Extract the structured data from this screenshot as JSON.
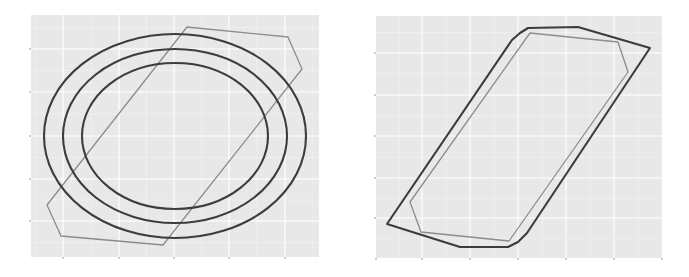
{
  "figure": {
    "background": "#ffffff",
    "panel_bg": "#e8e8e8",
    "grid_major": "#ffffff",
    "grid_minor": "#f3f3f3",
    "tick_color": "#9a9a9a",
    "dark_line": "#3c3c3c",
    "light_line": "#8c8c8c"
  },
  "chart_data": [
    {
      "type": "line",
      "title": "",
      "xlabel": "",
      "ylabel": "",
      "grid": true,
      "legend": null,
      "tick_labels_visible": false,
      "panel": {
        "x": 31,
        "y": 15,
        "w": 288,
        "h": 242
      },
      "x_ticks_px": [
        63,
        119,
        174,
        229,
        285
      ],
      "y_ticks_px": [
        49,
        92,
        136,
        179,
        221
      ],
      "series": [
        {
          "name": "ellipse-outer",
          "shape": "ellipse",
          "color": "dark",
          "cx": 175,
          "cy": 136,
          "rx": 131,
          "ry": 102
        },
        {
          "name": "ellipse-middle",
          "shape": "ellipse",
          "color": "dark",
          "cx": 175,
          "cy": 136,
          "rx": 112,
          "ry": 87
        },
        {
          "name": "ellipse-inner",
          "shape": "ellipse",
          "color": "dark",
          "cx": 175,
          "cy": 136,
          "rx": 93,
          "ry": 73
        },
        {
          "name": "hull-polygon",
          "shape": "polygon",
          "color": "light",
          "points": [
            [
              187,
              27
            ],
            [
              288,
              37
            ],
            [
              302,
              69
            ],
            [
              163,
              245
            ],
            [
              61,
              236
            ],
            [
              47,
              205
            ]
          ]
        }
      ]
    },
    {
      "type": "line",
      "title": "",
      "xlabel": "",
      "ylabel": "",
      "grid": true,
      "legend": null,
      "tick_labels_visible": false,
      "panel": {
        "x": 376,
        "y": 16,
        "w": 286,
        "h": 242
      },
      "x_ticks_px": [
        376,
        422,
        470,
        518,
        566,
        614,
        662
      ],
      "y_ticks_px": [
        53,
        95,
        136,
        178,
        218
      ],
      "series": [
        {
          "name": "outer-polygon",
          "shape": "polygon",
          "color": "dark",
          "points": [
            [
              387,
              224
            ],
            [
              460,
              247
            ],
            [
              508,
              247
            ],
            [
              518,
              242
            ],
            [
              527,
              233
            ],
            [
              650,
              48
            ],
            [
              578,
              27
            ],
            [
              528,
              28
            ],
            [
              520,
              33
            ],
            [
              512,
              40
            ]
          ]
        },
        {
          "name": "inner-polygon",
          "shape": "polygon",
          "color": "light",
          "points": [
            [
              410,
              202
            ],
            [
              421,
              232
            ],
            [
              509,
              241
            ],
            [
              628,
              72
            ],
            [
              618,
              42
            ],
            [
              530,
              33
            ]
          ]
        }
      ]
    }
  ]
}
